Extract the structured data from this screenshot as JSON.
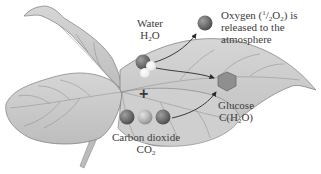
{
  "diagram": {
    "colors": {
      "background": "#ffffff",
      "leaf_fill": "#c9c9c9",
      "leaf_vein": "#8a8a8a",
      "leaf_outline": "#7a7a7a",
      "oxygen_atom": "#6e6e6e",
      "carbon_atom": "#b3b3b3",
      "hydrogen_atom": "#ececec",
      "glucose_hexagon": "#8f8f8f",
      "arrow": "#2a2a2a",
      "text": "#3c3c3c"
    },
    "labels": {
      "water": {
        "name": "Water",
        "formula_main": "H",
        "formula_sub": "2",
        "formula_tail": "O"
      },
      "oxygen": {
        "line1_prefix": "Oxygen (",
        "fraction_num": "1",
        "fraction_slash": "/",
        "fraction_den": "2",
        "line1_formula": "O",
        "line1_sub": "2",
        "line1_suffix": ") is",
        "line2": "released to the",
        "line3": "atmosphere"
      },
      "glucose": {
        "name": "Glucose",
        "formula_prefix": "C(H",
        "formula_sub": "2",
        "formula_suffix": "O)"
      },
      "carbon_dioxide": {
        "name": "Carbon dioxide",
        "formula_main": "CO",
        "formula_sub": "2"
      },
      "plus_sign": "+"
    },
    "molecules": [
      {
        "id": "water",
        "atoms": [
          "oxygen",
          "hydrogen",
          "hydrogen"
        ]
      },
      {
        "id": "carbon-dioxide",
        "atoms": [
          "oxygen",
          "carbon",
          "oxygen"
        ]
      },
      {
        "id": "oxygen-released",
        "atoms": [
          "oxygen"
        ]
      },
      {
        "id": "glucose",
        "shape": "hexagon"
      }
    ],
    "arrows": [
      {
        "from": "water",
        "to": "oxygen-released"
      },
      {
        "from": "water",
        "to": "glucose"
      },
      {
        "from": "carbon-dioxide",
        "to": "glucose"
      }
    ]
  }
}
